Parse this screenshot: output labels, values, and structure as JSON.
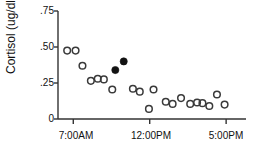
{
  "chart_data": {
    "type": "scatter",
    "title": "",
    "xlabel": "",
    "ylabel": "Cortisol (ug/dl)",
    "grid": false,
    "legend": "none",
    "xlim": [
      6.0,
      18.3
    ],
    "ylim": [
      0,
      0.75
    ],
    "yticks": [
      0,
      0.25,
      0.5,
      0.75
    ],
    "ytick_labels": [
      "0",
      ".25",
      ".50",
      ".75"
    ],
    "xticks": [
      7,
      12,
      17
    ],
    "xtick_labels": [
      "7:00AM",
      "12:00PM",
      "5:00PM"
    ],
    "series": [
      {
        "name": "open-markers",
        "marker": "open-circle",
        "color": "#333333",
        "points": [
          {
            "x": 6.6,
            "y": 0.475
          },
          {
            "x": 7.15,
            "y": 0.475
          },
          {
            "x": 7.6,
            "y": 0.37
          },
          {
            "x": 8.15,
            "y": 0.265
          },
          {
            "x": 8.6,
            "y": 0.28
          },
          {
            "x": 9.0,
            "y": 0.275
          },
          {
            "x": 9.55,
            "y": 0.205
          },
          {
            "x": 10.9,
            "y": 0.21
          },
          {
            "x": 11.35,
            "y": 0.19
          },
          {
            "x": 12.25,
            "y": 0.205
          },
          {
            "x": 11.95,
            "y": 0.07
          },
          {
            "x": 13.05,
            "y": 0.12
          },
          {
            "x": 13.5,
            "y": 0.105
          },
          {
            "x": 14.05,
            "y": 0.145
          },
          {
            "x": 14.65,
            "y": 0.105
          },
          {
            "x": 15.1,
            "y": 0.115
          },
          {
            "x": 15.45,
            "y": 0.11
          },
          {
            "x": 15.9,
            "y": 0.09
          },
          {
            "x": 16.4,
            "y": 0.17
          },
          {
            "x": 16.9,
            "y": 0.1
          }
        ]
      },
      {
        "name": "filled-markers",
        "marker": "filled-circle",
        "color": "#111111",
        "points": [
          {
            "x": 9.75,
            "y": 0.34
          },
          {
            "x": 10.3,
            "y": 0.4
          }
        ]
      }
    ]
  },
  "axes": {
    "y_axis_title": "Cortisol (ug/dl)",
    "y_tick_75": ".75",
    "y_tick_50": ".50",
    "y_tick_25": ".25",
    "y_tick_0": "0",
    "x_tick_7am": "7:00AM",
    "x_tick_12pm": "12:00PM",
    "x_tick_5pm": "5:00PM"
  },
  "style": {
    "axis_color": "#333333",
    "marker_open_stroke": "#3a3a3a",
    "marker_filled_fill": "#121212",
    "background": "#ffffff"
  }
}
